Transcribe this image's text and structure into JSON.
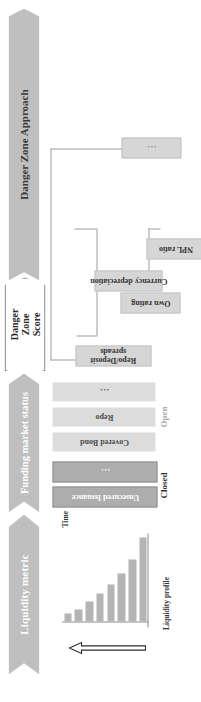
{
  "diagram": {
    "title": "Danger Zone Approach",
    "orientation": "rotated-90-ccw",
    "colors": {
      "banner_fill": "#bfbfbf",
      "banner_text": "#ffffff",
      "score_fill": "#ffffff",
      "score_border": "#4a4a4a",
      "closed_bar": "#adadad",
      "open_bar": "#dcdcdc",
      "node_fill": "#d6d6d6",
      "chart_bar": "#b4b4b4",
      "connector": "#9e9e9e"
    }
  },
  "banners": {
    "liquidity_metric": "Liquidity metric",
    "funding_market_status": "Funding market status",
    "danger_zone_score_line1": "Danger",
    "danger_zone_score_line2": "Zone",
    "danger_zone_score_line3": "Score",
    "danger_zone_approach": "Danger Zone Approach"
  },
  "chart_data": {
    "type": "bar",
    "title": "",
    "xlabel": "Time",
    "ylabel": "Liquidity profile",
    "categories": [
      "t1",
      "t2",
      "t3",
      "t4",
      "t5",
      "t6",
      "t7",
      "t8"
    ],
    "values": [
      100,
      74,
      57,
      44,
      33,
      24,
      14,
      9
    ],
    "ylim": [
      0,
      100
    ],
    "grid": false,
    "legend": false,
    "annotations": [
      "upward hollow arrow indicating time direction"
    ]
  },
  "funding_market": {
    "groups": [
      {
        "name": "Closed",
        "label": "Closed",
        "state": "closed",
        "bars": [
          {
            "label": "Unsecured Issuance",
            "is_ellipsis": false
          },
          {
            "label": "...",
            "is_ellipsis": true
          }
        ]
      },
      {
        "name": "Open",
        "label": "Open",
        "state": "open",
        "bars": [
          {
            "label": "Covered Bond",
            "is_ellipsis": false
          },
          {
            "label": "Repo",
            "is_ellipsis": false
          },
          {
            "label": "...",
            "is_ellipsis": true
          }
        ]
      }
    ]
  },
  "indicator_tree": {
    "nodes": [
      {
        "label": "Repo/Deposit spreads",
        "is_ellipsis": false
      },
      {
        "label": "Currency depreciation",
        "is_ellipsis": false
      },
      {
        "label": "Own rating",
        "is_ellipsis": false
      },
      {
        "label": "NPL ratio",
        "is_ellipsis": false
      },
      {
        "label": "...",
        "is_ellipsis": true
      }
    ]
  }
}
